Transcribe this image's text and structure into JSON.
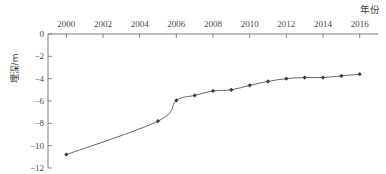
{
  "chart_data": {
    "type": "line",
    "title": "",
    "xlabel": "年份",
    "ylabel": "埋深/m",
    "xlim": [
      1999,
      2017
    ],
    "ylim": [
      -12,
      0
    ],
    "grid": false,
    "legend": null,
    "x_tick_labels": [
      "2000",
      "2002",
      "2004",
      "2006",
      "2008",
      "2010",
      "2012",
      "2014",
      "2016"
    ],
    "x_ticks": [
      2000,
      2002,
      2004,
      2006,
      2008,
      2010,
      2012,
      2014,
      2016
    ],
    "y_tick_labels": [
      "0",
      "−2",
      "−4",
      "−6",
      "−8",
      "−10",
      "−12"
    ],
    "y_ticks": [
      0,
      -2,
      -4,
      -6,
      -8,
      -10,
      -12
    ],
    "x_axis_position": "top",
    "series": [
      {
        "name": "埋深",
        "marker": "diamond",
        "color": "#555555",
        "x": [
          2000,
          2005,
          2006,
          2007,
          2008,
          2009,
          2010,
          2011,
          2012,
          2013,
          2014,
          2015,
          2016
        ],
        "values": [
          -10.8,
          -7.8,
          -5.95,
          -5.5,
          -5.1,
          -5.0,
          -4.6,
          -4.25,
          -4.0,
          -3.9,
          -3.9,
          -3.75,
          -3.6
        ]
      }
    ]
  },
  "axes": {
    "y_title": "埋深/m",
    "x_title": "年份"
  },
  "colors": {
    "line": "#5a5a5a",
    "marker": "#3c3c3c",
    "axis": "#6e6e6e",
    "text": "#4a4a4a"
  }
}
